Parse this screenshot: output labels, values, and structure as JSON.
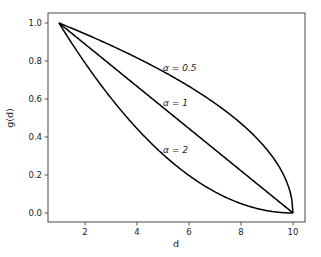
{
  "chart_data": {
    "type": "line",
    "title": "",
    "xlabel": "d",
    "ylabel": "g(d)",
    "xlim": [
      0.6,
      10.4
    ],
    "ylim": [
      -0.05,
      1.05
    ],
    "xticks": [
      2,
      4,
      6,
      8,
      10
    ],
    "xtick_labels": [
      "2",
      "4",
      "6",
      "8",
      "10"
    ],
    "yticks": [
      0.0,
      0.2,
      0.4,
      0.6,
      0.8,
      1.0
    ],
    "ytick_labels": [
      "0.0",
      "0.2",
      "0.4",
      "0.6",
      "0.8",
      "1.0"
    ],
    "grid": false,
    "legend": null,
    "x": [
      1,
      2,
      3,
      4,
      5,
      6,
      7,
      8,
      9,
      10
    ],
    "series": [
      {
        "name": "α = 0.5",
        "alpha": 0.5,
        "color": "#000000",
        "values": [
          1.0,
          0.943,
          0.882,
          0.816,
          0.745,
          0.667,
          0.577,
          0.471,
          0.333,
          0.0
        ]
      },
      {
        "name": "α = 1",
        "alpha": 1,
        "color": "#000000",
        "values": [
          1.0,
          0.889,
          0.778,
          0.667,
          0.556,
          0.444,
          0.333,
          0.222,
          0.111,
          0.0
        ]
      },
      {
        "name": "α = 2",
        "alpha": 2,
        "color": "#000000",
        "values": [
          1.0,
          0.79,
          0.605,
          0.444,
          0.309,
          0.198,
          0.111,
          0.049,
          0.012,
          0.0
        ]
      }
    ],
    "annotations": [
      {
        "text": "α = 0.5",
        "x": 5.2,
        "y": 0.86
      },
      {
        "text": "α = 1",
        "x": 5.2,
        "y": 0.69
      },
      {
        "text": "α = 2",
        "x": 5.2,
        "y": 0.44
      }
    ]
  },
  "labels": {
    "xlabel": "d",
    "ylabel": "g(d)",
    "annot_05": "α = 0.5",
    "annot_1": "α = 1",
    "annot_2": "α = 2"
  }
}
